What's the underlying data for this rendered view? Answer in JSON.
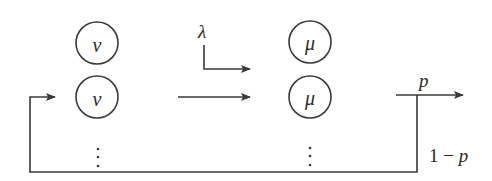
{
  "diagram": {
    "type": "queueing-network",
    "stroke_color": "#3a3a3a",
    "nodes": {
      "arrival_servers": [
        {
          "id": "nu-1",
          "label": "ν",
          "cx": 97,
          "cy": 43,
          "r": 21
        },
        {
          "id": "nu-2",
          "label": "ν",
          "cx": 97,
          "cy": 97,
          "r": 21
        }
      ],
      "service_servers": [
        {
          "id": "mu-1",
          "label": "μ",
          "cx": 310,
          "cy": 42,
          "r": 21
        },
        {
          "id": "mu-2",
          "label": "μ",
          "cx": 310,
          "cy": 97,
          "r": 21
        }
      ],
      "ellipsis": [
        {
          "id": "dots-nu",
          "label": "⋮",
          "x": 98
        },
        {
          "id": "dots-mu",
          "label": "⋮",
          "x": 310
        }
      ]
    },
    "edges": {
      "arrival_rate": {
        "label": "λ"
      },
      "exit": {
        "label": "p"
      },
      "feedback": {
        "label_num": "1",
        "label_op": " − ",
        "label_var": "p"
      }
    }
  }
}
